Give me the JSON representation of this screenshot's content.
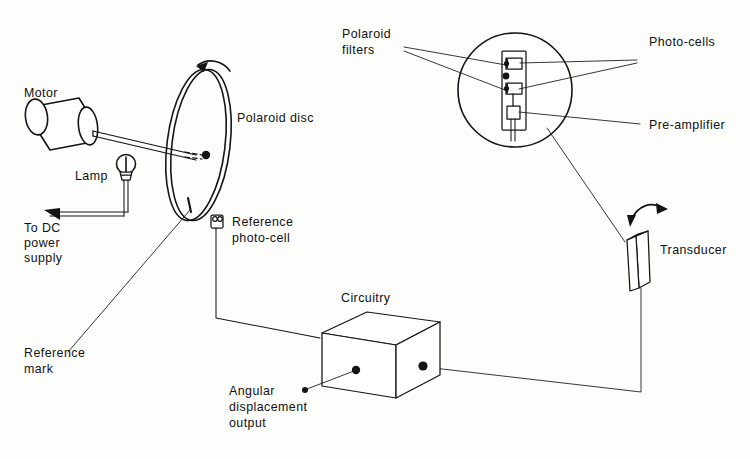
{
  "figure": {
    "type": "technical-line-diagram",
    "background_color": "#fdfdfb",
    "line_color": "#141414",
    "width": 750,
    "height": 459
  },
  "labels": {
    "motor": "Motor",
    "lamp": "Lamp",
    "dc_supply_line1": "To DC",
    "dc_supply_line2": "power",
    "dc_supply_line3": "supply",
    "polaroid_disc": "Polaroid disc",
    "reference_photocell_line1": "Reference",
    "reference_photocell_line2": "photo-cell",
    "reference_mark_line1": "Reference",
    "reference_mark_line2": "mark",
    "polaroid_filters_line1": "Polaroid",
    "polaroid_filters_line2": "filters",
    "photocells": "Photo-cells",
    "preamplifier": "Pre-amplifier",
    "transducer": "Transducer",
    "circuitry": "Circuitry",
    "angular_output_line1": "Angular",
    "angular_output_line2": "displacement",
    "angular_output_line3": "output"
  },
  "components": [
    {
      "id": "motor",
      "name": "Motor",
      "shape": "cylinder"
    },
    {
      "id": "shaft",
      "name": "Drive shaft",
      "shape": "rod"
    },
    {
      "id": "lamp",
      "name": "Lamp",
      "shape": "bulb"
    },
    {
      "id": "dc-supply-wire",
      "name": "To DC power supply",
      "shape": "arrow-wire"
    },
    {
      "id": "polaroid-disc",
      "name": "Polaroid disc",
      "shape": "ellipse-disc"
    },
    {
      "id": "reference-mark",
      "name": "Reference mark",
      "shape": "tick"
    },
    {
      "id": "reference-photocell",
      "name": "Reference photo-cell",
      "shape": "small-cell"
    },
    {
      "id": "detail-circle",
      "name": "Detail magnifier circle",
      "shape": "circle"
    },
    {
      "id": "polaroid-filters",
      "name": "Polaroid filters",
      "shape": "stacked-plates"
    },
    {
      "id": "photocells",
      "name": "Photo-cells",
      "shape": "stacked-plates"
    },
    {
      "id": "preamplifier",
      "name": "Pre-amplifier",
      "shape": "small-box"
    },
    {
      "id": "transducer",
      "name": "Transducer",
      "shape": "prism"
    },
    {
      "id": "circuitry",
      "name": "Circuitry",
      "shape": "box-3d"
    },
    {
      "id": "angular-output",
      "name": "Angular displacement output",
      "shape": "terminal-dot"
    }
  ],
  "annotations": {
    "disc_rotation_arrow": "counter-clockwise rotation of polaroid disc",
    "transducer_rotation_arrow": "angular oscillation of transducer"
  }
}
